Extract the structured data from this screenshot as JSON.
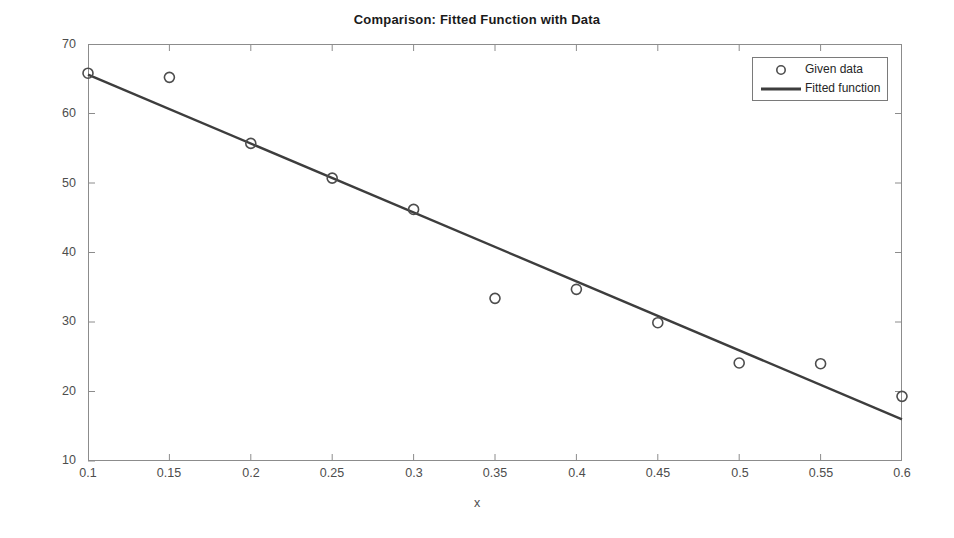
{
  "chart_data": {
    "type": "scatter",
    "title": "Comparison: Fitted Function with Data",
    "xlabel": "x",
    "ylabel": "y",
    "xlim": [
      0.1,
      0.6
    ],
    "ylim": [
      10,
      70
    ],
    "grid": false,
    "legend_position": "top-right",
    "xticks": [
      "0.1",
      "0.15",
      "0.2",
      "0.25",
      "0.3",
      "0.35",
      "0.4",
      "0.45",
      "0.5",
      "0.55",
      "0.6"
    ],
    "xtick_values": [
      0.1,
      0.15,
      0.2,
      0.25,
      0.3,
      0.35,
      0.4,
      0.45,
      0.5,
      0.55,
      0.6
    ],
    "yticks": [
      "10",
      "20",
      "30",
      "40",
      "50",
      "60",
      "70"
    ],
    "ytick_values": [
      10,
      20,
      30,
      40,
      50,
      60,
      70
    ],
    "series": [
      {
        "name": "Given data",
        "type": "scatter",
        "marker": "circle-open",
        "color": "#4d4d4d",
        "x": [
          0.1,
          0.15,
          0.2,
          0.25,
          0.3,
          0.35,
          0.4,
          0.45,
          0.5,
          0.55,
          0.6
        ],
        "values": [
          65.8,
          65.2,
          55.7,
          50.7,
          46.2,
          33.4,
          34.7,
          29.9,
          24.1,
          24.0,
          19.3
        ]
      },
      {
        "name": "Fitted function",
        "type": "line",
        "color": "#3d3d3d",
        "x": [
          0.1,
          0.6
        ],
        "values": [
          65.6,
          16.0
        ]
      }
    ]
  },
  "legend": {
    "entries": [
      {
        "label": "Given data",
        "marker": "circle-open-icon"
      },
      {
        "label": "Fitted function",
        "marker": "line-icon"
      }
    ]
  }
}
